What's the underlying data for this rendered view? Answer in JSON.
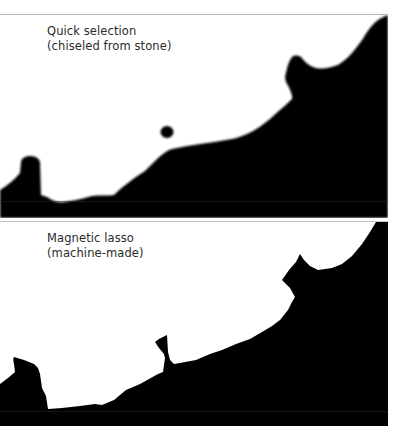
{
  "panels": [
    {
      "title": "Quick selection",
      "subtitle": "(chiseled from stone)",
      "mask_color": "#000000",
      "background": "#ffffff"
    },
    {
      "title": "Magnetic lasso",
      "subtitle": "(machine-made)",
      "mask_color": "#000000",
      "background": "#ffffff"
    }
  ]
}
